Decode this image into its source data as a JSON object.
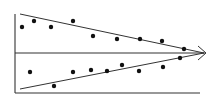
{
  "diagram": {
    "type": "converging-trend-scatter",
    "colors": {
      "line": "#333333",
      "point": "#111111",
      "background": "#ffffff"
    },
    "axes": {
      "left_axis": {
        "x": 15,
        "y1": 14,
        "y2": 93
      },
      "bottom_axis": {
        "y": 93,
        "x1": 15,
        "x2": 200
      },
      "center_axis": {
        "y": 53,
        "x1": 15,
        "x2": 205
      }
    },
    "arrow": {
      "tip": [
        206,
        53
      ],
      "arm_top": [
        198,
        46
      ],
      "arm_bottom": [
        198,
        60
      ]
    },
    "trend_lines": [
      {
        "name": "upper-bound",
        "from": [
          20,
          14
        ],
        "to": [
          204,
          53
        ]
      },
      {
        "name": "lower-bound",
        "from": [
          20,
          89
        ],
        "to": [
          204,
          53
        ]
      }
    ],
    "series": [
      {
        "name": "upper-points",
        "points": [
          [
            22,
            27
          ],
          [
            34,
            21
          ],
          [
            51,
            27
          ],
          [
            73,
            21
          ],
          [
            93,
            36
          ],
          [
            117,
            39
          ],
          [
            140,
            39
          ],
          [
            162,
            41
          ],
          [
            184,
            49
          ]
        ]
      },
      {
        "name": "lower-points",
        "points": [
          [
            30,
            72
          ],
          [
            54,
            86
          ],
          [
            73,
            72
          ],
          [
            91,
            70
          ],
          [
            107,
            71
          ],
          [
            122,
            65
          ],
          [
            139,
            71
          ],
          [
            163,
            67
          ],
          [
            180,
            58
          ]
        ]
      }
    ],
    "point_radius": 2.2
  }
}
